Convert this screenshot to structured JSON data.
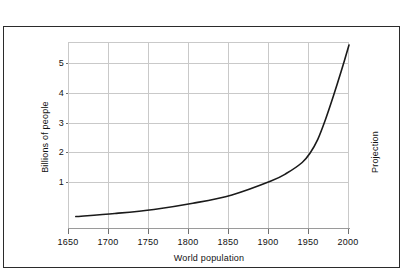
{
  "chart_data": {
    "type": "line",
    "title": "",
    "xlabel": "World population",
    "ylabel": "Billions of people",
    "xlim": [
      1640,
      2000
    ],
    "ylim": [
      0.18,
      6.2
    ],
    "grid": true,
    "legend": null,
    "xticks": [
      "1650",
      "1700",
      "1750",
      "1800",
      "1850",
      "1900",
      "1950",
      "2000"
    ],
    "xtick_values": [
      1650,
      1700,
      1750,
      1800,
      1850,
      1900,
      1950,
      2000
    ],
    "yticks": [
      "1",
      "2",
      "3",
      "4",
      "5"
    ],
    "ytick_values": [
      1,
      2,
      3,
      4,
      5
    ],
    "annotations": [
      {
        "text": "Projection",
        "position": "right-of-plot",
        "rotation": -90
      }
    ],
    "series": [
      {
        "name": "World population",
        "color": "#1a1a1a",
        "x": [
          1650,
          1700,
          1750,
          1800,
          1850,
          1900,
          1920,
          1940,
          1950,
          1960,
          1970,
          1980,
          1990,
          2000
        ],
        "values": [
          0.55,
          0.65,
          0.78,
          0.98,
          1.25,
          1.7,
          1.95,
          2.3,
          2.6,
          3.05,
          3.7,
          4.45,
          5.25,
          6.1
        ]
      }
    ]
  },
  "labels": {
    "axis_title_x": "World population",
    "axis_title_y": "Billions of people",
    "projection": "Projection",
    "x": {
      "t0": "1650",
      "t1": "1700",
      "t2": "1750",
      "t3": "1800",
      "t4": "1850",
      "t5": "1900",
      "t6": "1950",
      "t7": "2000"
    },
    "y": {
      "t0": "1",
      "t1": "2",
      "t2": "3",
      "t3": "4",
      "t4": "5"
    }
  },
  "colors": {
    "curve": "#1a1a1a",
    "grid": "#c9c9c9",
    "frame": "#2b2b2b",
    "background": "#ffffff",
    "text": "#111111"
  }
}
